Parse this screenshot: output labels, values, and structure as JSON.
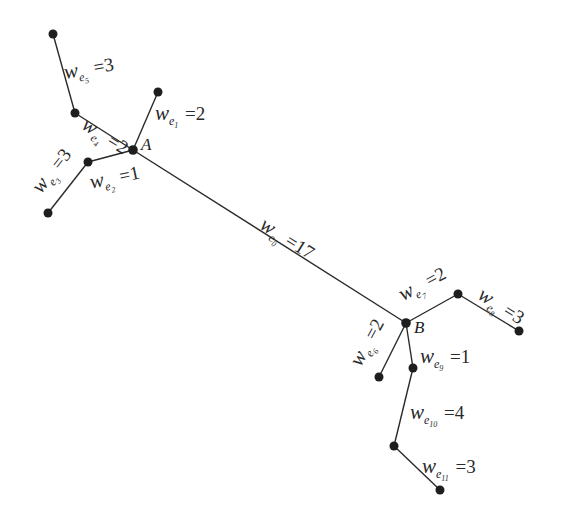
{
  "diagram": {
    "type": "weighted-tree",
    "vertices": {
      "A": {
        "label": "A",
        "x": 133,
        "y": 150
      },
      "B": {
        "label": "B",
        "x": 406,
        "y": 323
      }
    },
    "nodes": [
      {
        "id": "n_e5",
        "x": 53,
        "y": 34
      },
      {
        "id": "n_e4",
        "x": 75,
        "y": 113
      },
      {
        "id": "n_e1",
        "x": 158,
        "y": 92
      },
      {
        "id": "A",
        "x": 133,
        "y": 150
      },
      {
        "id": "n_e2",
        "x": 88,
        "y": 162
      },
      {
        "id": "n_e3",
        "x": 48,
        "y": 213
      },
      {
        "id": "B",
        "x": 406,
        "y": 323
      },
      {
        "id": "n_e7",
        "x": 458,
        "y": 294
      },
      {
        "id": "n_e8",
        "x": 519,
        "y": 331
      },
      {
        "id": "n_e6",
        "x": 379,
        "y": 377
      },
      {
        "id": "n_e9",
        "x": 413,
        "y": 368
      },
      {
        "id": "n_e10",
        "x": 394,
        "y": 446
      },
      {
        "id": "n_e11",
        "x": 440,
        "y": 490
      }
    ],
    "edges": [
      {
        "id": "e0",
        "from": "A",
        "to": "B",
        "weight": 17,
        "w": "w",
        "sub": "e",
        "idx": "0"
      },
      {
        "id": "e1",
        "from": "A",
        "to": "n_e1",
        "weight": 2,
        "w": "w",
        "sub": "e",
        "idx": "1"
      },
      {
        "id": "e2",
        "from": "A",
        "to": "n_e2",
        "weight": 1,
        "w": "w",
        "sub": "e",
        "idx": "2"
      },
      {
        "id": "e3",
        "from": "n_e2",
        "to": "n_e3",
        "weight": 3,
        "w": "w",
        "sub": "e",
        "idx": "3"
      },
      {
        "id": "e4",
        "from": "A",
        "to": "n_e4",
        "weight": 2,
        "w": "w",
        "sub": "e",
        "idx": "4"
      },
      {
        "id": "e5",
        "from": "n_e4",
        "to": "n_e5",
        "weight": 3,
        "w": "w",
        "sub": "e",
        "idx": "5"
      },
      {
        "id": "e6",
        "from": "B",
        "to": "n_e6",
        "weight": 2,
        "w": "w",
        "sub": "e",
        "idx": "6"
      },
      {
        "id": "e7",
        "from": "B",
        "to": "n_e7",
        "weight": 2,
        "w": "w",
        "sub": "e",
        "idx": "7"
      },
      {
        "id": "e8",
        "from": "n_e7",
        "to": "n_e8",
        "weight": 3,
        "w": "w",
        "sub": "e",
        "idx": "8"
      },
      {
        "id": "e9",
        "from": "B",
        "to": "n_e9",
        "weight": 1,
        "w": "w",
        "sub": "e",
        "idx": "9"
      },
      {
        "id": "e10",
        "from": "n_e9",
        "to": "n_e10",
        "weight": 4,
        "w": "w",
        "sub": "e",
        "idx": "10"
      },
      {
        "id": "e11",
        "from": "n_e10",
        "to": "n_e11",
        "weight": 3,
        "w": "w",
        "sub": "e",
        "idx": "11"
      }
    ],
    "labels": {
      "e0": {
        "w": "w",
        "sub": "e",
        "idx": "0",
        "eq": "=",
        "val": "17"
      },
      "e1": {
        "w": "w",
        "sub": "e",
        "idx": "1",
        "eq": "=",
        "val": "2"
      },
      "e2": {
        "w": "w",
        "sub": "e",
        "idx": "2",
        "eq": "=",
        "val": "1"
      },
      "e3": {
        "w": "w",
        "sub": "e",
        "idx": "3",
        "eq": "=",
        "val": "3"
      },
      "e4": {
        "w": "w",
        "sub": "e",
        "idx": "4",
        "eq": "=",
        "val": "2"
      },
      "e5": {
        "w": "w",
        "sub": "e",
        "idx": "5",
        "eq": "=",
        "val": "3"
      },
      "e6": {
        "w": "w",
        "sub": "e",
        "idx": "6",
        "eq": "=",
        "val": "2"
      },
      "e7": {
        "w": "w",
        "sub": "e",
        "idx": "7",
        "eq": "=",
        "val": "2"
      },
      "e8": {
        "w": "w",
        "sub": "e",
        "idx": "8",
        "eq": "=",
        "val": "3"
      },
      "e9": {
        "w": "w",
        "sub": "e",
        "idx": "9",
        "eq": "=",
        "val": "1"
      },
      "e10": {
        "w": "w",
        "sub": "e",
        "idx": "10",
        "eq": "=",
        "val": "4"
      },
      "e11": {
        "w": "w",
        "sub": "e",
        "idx": "11",
        "eq": "=",
        "val": "3"
      }
    },
    "colors": {
      "line": "#2a2a2a",
      "node": "#1e1e1e",
      "background": "#ffffff"
    }
  }
}
